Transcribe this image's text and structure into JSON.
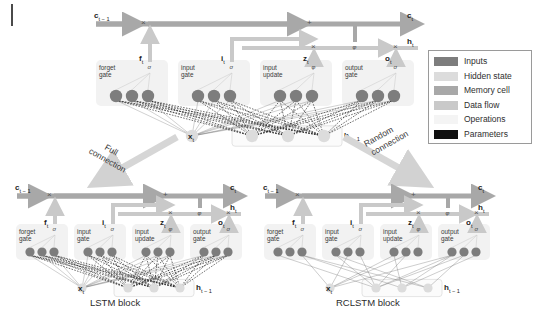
{
  "figure": {
    "page_tick": "page-margin-tick"
  },
  "legend": {
    "items": [
      {
        "label": "Inputs",
        "color": "#7d7d7d"
      },
      {
        "label": "Hidden state",
        "color": "#dcdcdc"
      },
      {
        "label": "Memory cell",
        "color": "#a8a8a8"
      },
      {
        "label": "Data flow",
        "color": "#c9c9c9"
      },
      {
        "label": "Operations",
        "color": "#f2f2f2"
      },
      {
        "label": "Parameters",
        "color": "#101010"
      }
    ]
  },
  "transitions": [
    {
      "name": "full-connection",
      "label_line1": "Full",
      "label_line2": "connection"
    },
    {
      "name": "random-connection",
      "label_line1": "Random",
      "label_line2": "connection"
    }
  ],
  "blocks": [
    {
      "name": "top-lstm-block",
      "caption": "",
      "connection_style": "full",
      "cell_in": "c",
      "cell_in_sub": "t − 1",
      "cell_out": "c",
      "cell_out_sub": "t",
      "hidden_out": "h",
      "hidden_out_sub": "t",
      "input_label": "x",
      "input_sub": "t",
      "hidden_in": "h",
      "hidden_in_sub": "t − 1",
      "gates": [
        {
          "name": "forget-gate",
          "line1": "forget",
          "line2": "gate",
          "symbol": "σ",
          "signal": "f",
          "signal_sub": "t",
          "nodes": 3
        },
        {
          "name": "input-gate",
          "line1": "input",
          "line2": "gate",
          "symbol": "σ",
          "signal": "i",
          "signal_sub": "t",
          "nodes": 3
        },
        {
          "name": "input-update",
          "line1": "input",
          "line2": "update",
          "symbol": "φ",
          "signal": "z",
          "signal_sub": "t",
          "nodes": 3
        },
        {
          "name": "output-gate",
          "line1": "output",
          "line2": "gate",
          "symbol": "σ",
          "signal": "o",
          "signal_sub": "t",
          "nodes": 3
        }
      ],
      "operations": [
        "×",
        "+",
        "×",
        "φ",
        "×"
      ]
    },
    {
      "name": "lstm-block",
      "caption": "LSTM block",
      "connection_style": "full",
      "cell_in": "c",
      "cell_in_sub": "t − 1",
      "cell_out": "c",
      "cell_out_sub": "t",
      "hidden_out": "h",
      "hidden_out_sub": "t",
      "input_label": "x",
      "input_sub": "t",
      "hidden_in": "h",
      "hidden_in_sub": "t − 1",
      "gates": [
        {
          "name": "forget-gate",
          "line1": "forget",
          "line2": "gate",
          "symbol": "σ",
          "signal": "f",
          "signal_sub": "t",
          "nodes": 3
        },
        {
          "name": "input-gate",
          "line1": "input",
          "line2": "gate",
          "symbol": "σ",
          "signal": "i",
          "signal_sub": "t",
          "nodes": 3
        },
        {
          "name": "input-update",
          "line1": "input",
          "line2": "update",
          "symbol": "φ",
          "signal": "z",
          "signal_sub": "t",
          "nodes": 3
        },
        {
          "name": "output-gate",
          "line1": "output",
          "line2": "gate",
          "symbol": "σ",
          "signal": "o",
          "signal_sub": "t",
          "nodes": 3
        }
      ],
      "operations": [
        "×",
        "+",
        "×",
        "φ",
        "×"
      ]
    },
    {
      "name": "rclstm-block",
      "caption": "RCLSTM block",
      "connection_style": "random",
      "cell_in": "c",
      "cell_in_sub": "t − 1",
      "cell_out": "c",
      "cell_out_sub": "t",
      "hidden_out": "h",
      "hidden_out_sub": "t",
      "input_label": "x",
      "input_sub": "t",
      "hidden_in": "h",
      "hidden_in_sub": "t − 1",
      "gates": [
        {
          "name": "forget-gate",
          "line1": "forget",
          "line2": "gate",
          "symbol": "σ",
          "signal": "f",
          "signal_sub": "t",
          "nodes": 3
        },
        {
          "name": "input-gate",
          "line1": "input",
          "line2": "gate",
          "symbol": "σ",
          "signal": "i",
          "signal_sub": "t",
          "nodes": 3
        },
        {
          "name": "input-update",
          "line1": "input",
          "line2": "update",
          "symbol": "φ",
          "signal": "z",
          "signal_sub": "t",
          "nodes": 3
        },
        {
          "name": "output-gate",
          "line1": "output",
          "line2": "gate",
          "symbol": "σ",
          "signal": "o",
          "signal_sub": "t",
          "nodes": 3
        }
      ],
      "operations": [
        "×",
        "+",
        "×",
        "φ",
        "×"
      ]
    }
  ],
  "colors": {
    "cell_rail": "#a8a8a8",
    "data_flow": "#c9c9c9",
    "node_input": "#7d7d7d",
    "node_hidden": "#dcdcdc",
    "panel": "#f2f2f2",
    "parameters": "#101010"
  }
}
